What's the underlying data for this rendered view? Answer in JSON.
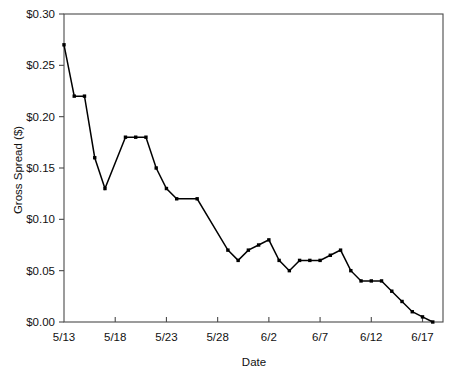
{
  "chart_data": {
    "type": "line",
    "title": "",
    "xlabel": "Date",
    "ylabel": "Gross Spread ($)",
    "x": [
      "5/13",
      "5/14",
      "5/15",
      "5/16",
      "5/17",
      "5/19",
      "5/20",
      "5/21",
      "5/22",
      "5/23",
      "5/24",
      "5/26",
      "5/29",
      "5/30",
      "5/31",
      "6/1",
      "6/2",
      "6/3",
      "6/4",
      "6/5",
      "6/6",
      "6/7",
      "6/8",
      "6/9",
      "6/10",
      "6/11",
      "6/12",
      "6/13",
      "6/14",
      "6/15",
      "6/16",
      "6/17",
      "6/18"
    ],
    "x_positions": [
      0,
      1,
      2,
      3,
      4,
      6,
      7,
      8,
      9,
      10,
      11,
      13,
      16,
      17,
      18,
      19,
      20,
      21,
      22,
      23,
      24,
      25,
      26,
      27,
      28,
      29,
      30,
      31,
      32,
      33,
      34,
      35,
      36
    ],
    "values": [
      0.27,
      0.22,
      0.22,
      0.16,
      0.13,
      0.18,
      0.18,
      0.18,
      0.15,
      0.13,
      0.12,
      0.12,
      0.07,
      0.06,
      0.07,
      0.075,
      0.08,
      0.06,
      0.05,
      0.06,
      0.06,
      0.06,
      0.065,
      0.07,
      0.05,
      0.04,
      0.04,
      0.04,
      0.03,
      0.02,
      0.01,
      0.005,
      0.0
    ],
    "series": [
      {
        "name": "Gross Spread",
        "values": [
          0.27,
          0.22,
          0.22,
          0.16,
          0.13,
          0.18,
          0.18,
          0.18,
          0.15,
          0.13,
          0.12,
          0.12,
          0.07,
          0.06,
          0.07,
          0.075,
          0.08,
          0.06,
          0.05,
          0.06,
          0.06,
          0.06,
          0.065,
          0.07,
          0.05,
          0.04,
          0.04,
          0.04,
          0.03,
          0.02,
          0.01,
          0.005,
          0.0
        ]
      }
    ],
    "ylim": [
      0.0,
      0.3
    ],
    "xlim": [
      0,
      37
    ],
    "ytick_values": [
      0.0,
      0.05,
      0.1,
      0.15,
      0.2,
      0.25,
      0.3
    ],
    "ytick_labels": [
      "$0.00",
      "$0.05",
      "$0.10",
      "$0.15",
      "$0.20",
      "$0.25",
      "$0.30"
    ],
    "xtick_positions": [
      5,
      10,
      15,
      20,
      25,
      30,
      35
    ],
    "xtick_labels": [
      "5/13",
      "5/18",
      "5/23",
      "5/28",
      "6/2",
      "6/7",
      "6/12",
      "6/17"
    ],
    "xtick_label_positions": [
      0,
      5,
      10,
      15,
      20,
      25,
      30,
      35
    ],
    "grid": false,
    "legend": "none",
    "marker": "filled-square",
    "line_color": "#000000",
    "marker_color": "#000000",
    "background_color": "#ffffff",
    "frame_color": "#4a4a4a"
  }
}
